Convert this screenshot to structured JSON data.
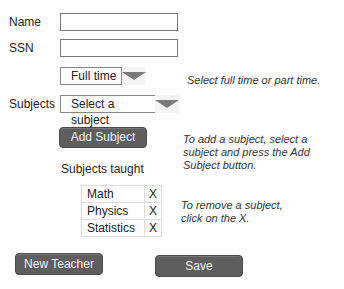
{
  "form": {
    "name_label": "Name",
    "name_value": "",
    "ssn_label": "SSN",
    "ssn_value": "",
    "employment": {
      "selected": "Full time",
      "hint": "Select full time or part time."
    },
    "subjects_label": "Subjects",
    "subject_select": {
      "selected": "Select a subject"
    },
    "add_subject_button": "Add Subject",
    "add_hint": "To add a subject, select a subject and press the Add Subject button.",
    "subjects_taught_label": "Subjects taught",
    "subjects_taught": [
      {
        "name": "Math",
        "remove": "X"
      },
      {
        "name": "Physics",
        "remove": "X"
      },
      {
        "name": "Statistics",
        "remove": "X"
      }
    ],
    "remove_hint": "To remove a subject, click on the X."
  },
  "footer": {
    "new_teacher_button": "New Teacher",
    "save_button": "Save"
  }
}
